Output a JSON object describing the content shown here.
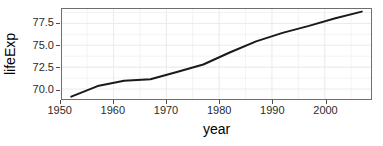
{
  "chart_data": {
    "type": "line",
    "title": "",
    "xlabel": "year",
    "ylabel": "lifeExp",
    "xlim": [
      1950.25,
      1961.0
    ],
    "ylim": [
      68.85,
      79.15
    ],
    "grid": true,
    "legend": null,
    "x_ticks": [
      1950,
      1960,
      1970,
      1980,
      1990,
      2000
    ],
    "y_ticks": [
      70.0,
      72.5,
      75.0,
      77.5
    ],
    "x_tick_labels": [
      "1950",
      "1960",
      "1970",
      "1980",
      "1990",
      "2000"
    ],
    "y_tick_labels": [
      "70.0",
      "72.5",
      "75.0",
      "77.5"
    ],
    "x": [
      1952,
      1957,
      1962,
      1967,
      1972,
      1977,
      1982,
      1987,
      1992,
      1997,
      2002,
      2007
    ],
    "series": [
      {
        "name": "lifeExp",
        "values": [
          69.12,
          70.33,
          70.93,
          71.1,
          71.93,
          72.8,
          74.17,
          75.45,
          76.42,
          77.22,
          78.1,
          78.85
        ],
        "color": "#1a1a1a",
        "line_width": 2.0
      }
    ],
    "axes": {
      "x_limits": [
        1950.25,
        2008.75
      ],
      "y_limits": [
        68.85,
        79.15
      ]
    },
    "style": {
      "panel_background": "#ffffff",
      "panel_border": "#6e6e6e",
      "grid_color": "#ebebeb",
      "tick_color": "#4d4d4d",
      "text_color": "#2b2b2b",
      "title_color": "#000000"
    }
  }
}
